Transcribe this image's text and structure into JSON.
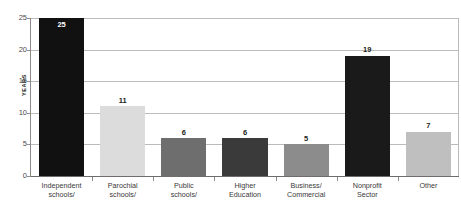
{
  "chart_data": {
    "type": "bar",
    "title": "",
    "xlabel": "",
    "ylabel": "YEARS",
    "ylim": [
      0,
      25
    ],
    "yticks": [
      0,
      5,
      10,
      15,
      20,
      25
    ],
    "grid": true,
    "legend": "none",
    "categories": [
      "Independent schools/",
      "Parochial schools/",
      "Public schools/",
      "Higher Education",
      "Business/ Commercial",
      "Nonprofit Sector",
      "Other"
    ],
    "category_lines": [
      [
        "Independent",
        "schools/"
      ],
      [
        "Parochial",
        "schools/"
      ],
      [
        "Public",
        "schools/"
      ],
      [
        "Higher",
        "Education"
      ],
      [
        "Business/",
        "Commercial"
      ],
      [
        "Nonprofit",
        "Sector"
      ],
      [
        "Other"
      ]
    ],
    "values": [
      25,
      11,
      6,
      6,
      5,
      19,
      7
    ],
    "bar_colors": [
      "#111111",
      "#dcdcdc",
      "#6e6e6e",
      "#3a3a3a",
      "#8c8c8c",
      "#1a1a1a",
      "#bfbfbf"
    ],
    "label_placement": [
      "inside",
      "above",
      "above",
      "above",
      "above",
      "above",
      "above"
    ]
  },
  "axis": {
    "y_title": "YEARS",
    "y_tick_labels": [
      "25",
      "20",
      "15",
      "10",
      "5",
      "0"
    ]
  },
  "values_text": [
    "25",
    "11",
    "6",
    "6",
    "5",
    "19",
    "7"
  ]
}
